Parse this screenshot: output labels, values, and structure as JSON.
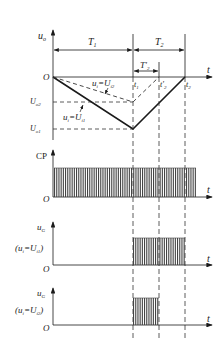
{
  "figure": {
    "panel1": {
      "ylabel": "u",
      "ylabel_sub": "o",
      "origin": "O",
      "t_axis": "t",
      "period1": "T",
      "period1_sub": "1",
      "period2": "T",
      "period2_sub": "2",
      "period2p": "T'",
      "period2p_sub": "2",
      "t1": "t",
      "t1_sub": "1",
      "t2p": "t'",
      "t2p_sub": "2",
      "t2": "t",
      "t2_sub": "2",
      "level_o2": "U",
      "level_o2_sub": "o2",
      "level_o1": "U",
      "level_o1_sub": "o1",
      "curve_dashed_label": "u",
      "curve_dashed_label_sub": "i",
      "curve_dashed_eq": "=U",
      "curve_dashed_eq_sub": "i2",
      "curve_solid_label": "u",
      "curve_solid_label_sub": "i",
      "curve_solid_eq": "=U",
      "curve_solid_eq_sub": "i1"
    },
    "panel2": {
      "ylabel": "CP",
      "origin": "O",
      "t_axis": "t"
    },
    "panel3": {
      "ylabel": "u",
      "ylabel_sub": "G",
      "condition": "(u",
      "condition_sub": "i",
      "condition_eq": "=U",
      "condition_eq_sub": "i1",
      "condition_close": ")",
      "origin": "O",
      "t_axis": "t"
    },
    "panel4": {
      "ylabel": "u",
      "ylabel_sub": "G",
      "condition": "(u",
      "condition_sub": "i",
      "condition_eq": "=U",
      "condition_eq_sub": "i2",
      "condition_close": ")",
      "origin": "O",
      "t_axis": "t"
    },
    "colors": {
      "line": "#1a1a1a",
      "dashed": "#333333",
      "pulse": "#444444"
    }
  }
}
